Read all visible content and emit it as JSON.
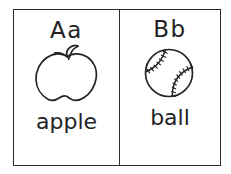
{
  "sheet": {
    "title": "Alphabet flashcards A and B",
    "background_color": "#ffffff",
    "ink_color": "#242424",
    "border_color": "#2b2b2b"
  },
  "cards": [
    {
      "letter_pair": "Aa",
      "uppercase": "A",
      "lowercase": "a",
      "word": "apple",
      "illustration": "apple-line-drawing"
    },
    {
      "letter_pair": "Bb",
      "uppercase": "B",
      "lowercase": "b",
      "word": "ball",
      "illustration": "baseball-line-drawing"
    }
  ]
}
